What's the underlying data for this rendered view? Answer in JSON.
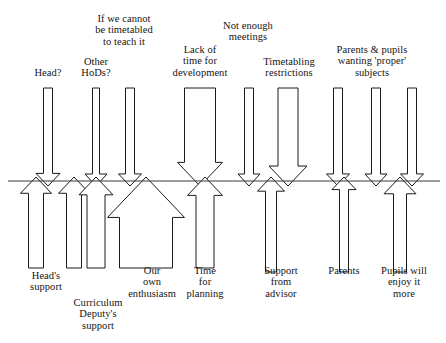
{
  "diagram": {
    "type": "force-field-analysis",
    "title": "",
    "divider_line": {
      "name": "equilibrium-line",
      "y": 181,
      "x_start": 8,
      "x_end": 440,
      "color": "#3a3a3a"
    },
    "colors": {
      "arrow_stroke": "#1a1a1a",
      "arrow_fill": "#ffffff",
      "text": "#141414",
      "line": "#3a3a3a",
      "background": "#ffffff"
    },
    "restraining_forces": [
      {
        "id": "head",
        "label": "Head?",
        "direction": "down",
        "label_x": 19,
        "label_y": 67,
        "label_width": 58,
        "shaft_cx": 48,
        "shaft_width": 9,
        "head_width": 24,
        "top_y": 88,
        "tip_y": 186
      },
      {
        "id": "other-hods",
        "label": "Other\nHoDs?",
        "direction": "down",
        "label_x": 70,
        "label_y": 56,
        "label_width": 52,
        "shaft_cx": 96,
        "shaft_width": 7,
        "head_width": 22,
        "top_y": 88,
        "tip_y": 186
      },
      {
        "id": "if-we-cannot-be-timetabled",
        "label": "If we cannot\nbe timetabled\nto teach it",
        "direction": "down",
        "label_x": 85,
        "label_y": 13,
        "label_width": 78,
        "shaft_cx": 130,
        "shaft_width": 9,
        "head_width": 23,
        "top_y": 88,
        "tip_y": 186
      },
      {
        "id": "lack-of-time-for-development",
        "label": "Lack of\ntime for\ndevelopment",
        "direction": "down",
        "label_x": 166,
        "label_y": 44,
        "label_width": 68,
        "shaft_cx": 200,
        "shaft_width": 31,
        "head_width": 45,
        "top_y": 88,
        "tip_y": 186
      },
      {
        "id": "not-enough-meetings",
        "label": "Not enough\nmeetings",
        "direction": "down",
        "label_x": 208,
        "label_y": 20,
        "label_width": 80,
        "shaft_cx": 249,
        "shaft_width": 9,
        "head_width": 22,
        "top_y": 88,
        "tip_y": 186
      },
      {
        "id": "timetabling-restrictions",
        "label": "Timetabling\nrestrictions",
        "direction": "down",
        "label_x": 253,
        "label_y": 56,
        "label_width": 72,
        "shaft_cx": 288,
        "shaft_width": 20,
        "head_width": 38,
        "top_y": 88,
        "tip_y": 186
      },
      {
        "id": "parents-pupils-proper-subjects-a",
        "label": "Parents & pupils\nwanting 'proper'\nsubjects",
        "direction": "down",
        "label_x": 318,
        "label_y": 44,
        "label_width": 108,
        "shaft_cx": 338,
        "shaft_width": 9,
        "head_width": 23,
        "top_y": 88,
        "tip_y": 186
      },
      {
        "id": "parents-pupils-proper-subjects-b",
        "label": "",
        "direction": "down",
        "shaft_cx": 376,
        "shaft_width": 9,
        "head_width": 22,
        "top_y": 88,
        "tip_y": 186
      },
      {
        "id": "parents-pupils-proper-subjects-c",
        "label": "",
        "direction": "down",
        "shaft_cx": 412,
        "shaft_width": 9,
        "head_width": 23,
        "top_y": 88,
        "tip_y": 186
      }
    ],
    "driving_forces": [
      {
        "id": "heads-support",
        "label": "Head's\nsupport",
        "direction": "up",
        "label_x": 18,
        "label_y": 270,
        "label_width": 56,
        "shaft_cx": 36,
        "shaft_width": 15,
        "head_width": 31,
        "bottom_y": 268,
        "tip_y": 177
      },
      {
        "id": "heads-support-b",
        "label": "",
        "direction": "up",
        "shaft_cx": 74,
        "shaft_width": 15,
        "head_width": 31,
        "bottom_y": 268,
        "tip_y": 177
      },
      {
        "id": "curriculum-deputys-support",
        "label": "Curriculum\nDeputy's\nsupport",
        "label_x": 60,
        "label_y": 297,
        "label_width": 76,
        "direction": "up",
        "shaft_cx": 96,
        "shaft_width": 18,
        "head_width": 34,
        "bottom_y": 268,
        "tip_y": 177
      },
      {
        "id": "our-own-enthusiasm",
        "label": "Our\nown\nenthusiasm",
        "direction": "up",
        "label_x": 116,
        "label_y": 265,
        "label_width": 72,
        "shaft_cx": 146,
        "shaft_width": 53,
        "head_width": 77,
        "bottom_y": 268,
        "tip_y": 177
      },
      {
        "id": "time-for-planning",
        "label": "Time\nfor\nplanning",
        "direction": "up",
        "label_x": 177,
        "label_y": 265,
        "label_width": 56,
        "shaft_cx": 205,
        "shaft_width": 18,
        "head_width": 35,
        "bottom_y": 268,
        "tip_y": 177
      },
      {
        "id": "support-from-advisor",
        "label": "Support\nfrom\nadvisor",
        "direction": "up",
        "label_x": 251,
        "label_y": 265,
        "label_width": 60,
        "shaft_cx": 271,
        "shaft_width": 11,
        "head_width": 27,
        "bottom_y": 272,
        "tip_y": 177
      },
      {
        "id": "parents",
        "label": "Parents",
        "direction": "up",
        "label_x": 317,
        "label_y": 265,
        "label_width": 54,
        "shaft_cx": 344,
        "shaft_width": 9,
        "head_width": 24,
        "bottom_y": 272,
        "tip_y": 177
      },
      {
        "id": "pupils-will-enjoy-it-more",
        "label": "Pupils will\nenjoy it\nmore",
        "direction": "up",
        "label_x": 372,
        "label_y": 265,
        "label_width": 64,
        "shaft_cx": 400,
        "shaft_width": 13,
        "head_width": 32,
        "bottom_y": 272,
        "tip_y": 177
      }
    ]
  }
}
